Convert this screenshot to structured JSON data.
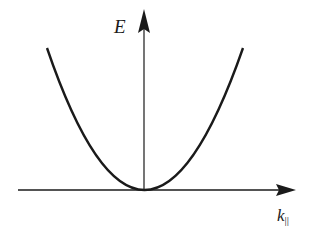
{
  "diagram": {
    "y_axis_label": "E",
    "x_axis_label": "k",
    "x_axis_subscript": "||",
    "curve": "parabola",
    "vertex": "origin",
    "colors": {
      "ink": "#1a1a1a",
      "background": "#ffffff"
    }
  }
}
